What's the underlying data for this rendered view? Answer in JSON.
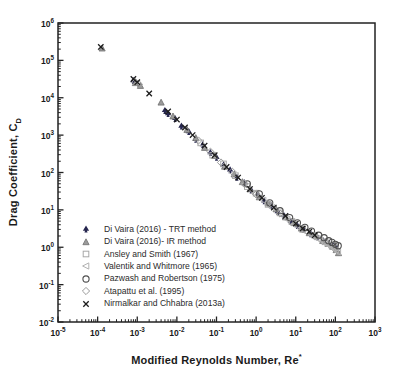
{
  "figure": {
    "background": "#ffffff",
    "text_color": "#1a1a1a",
    "axis_color": "#222222"
  },
  "chart_data": {
    "type": "scatter",
    "title": "",
    "xlabel": "Modified Reynolds Number, Re*",
    "ylabel": "Drag Coefficient, C_D",
    "xlabel_main": "Modified Reynolds Number, Re",
    "xlabel_sup": "*",
    "ylabel_main": "Drag Coefficient, C",
    "ylabel_sub": "D",
    "x_scale": "log",
    "y_scale": "log",
    "xlim": [
      1e-05,
      1000
    ],
    "ylim": [
      0.01,
      1000000
    ],
    "x_tick_exponents": [
      -5,
      -4,
      -3,
      -2,
      -1,
      0,
      1,
      2,
      3
    ],
    "y_tick_exponents": [
      6,
      5,
      4,
      3,
      2,
      1,
      0,
      -1,
      -2
    ],
    "grid": false,
    "legend_position": "inside-lower-left",
    "series": [
      {
        "name": "Di Vaira (2016) - TRT method",
        "marker": "club",
        "color": "#26264f",
        "fill": "#26264f",
        "points": [
          [
            0.0008,
            29000
          ],
          [
            0.005,
            4600
          ],
          [
            0.006,
            3800
          ],
          [
            0.009,
            2800
          ],
          [
            0.013,
            1750
          ],
          [
            0.02,
            1250
          ],
          [
            0.03,
            780
          ],
          [
            0.045,
            560
          ],
          [
            0.07,
            340
          ],
          [
            0.1,
            255
          ],
          [
            0.15,
            160
          ],
          [
            0.22,
            118
          ],
          [
            0.33,
            75
          ],
          [
            0.5,
            54
          ],
          [
            0.75,
            34
          ],
          [
            1.1,
            26
          ],
          [
            1.6,
            17.5
          ],
          [
            2.4,
            13
          ],
          [
            3.5,
            9
          ],
          [
            5,
            7.2
          ],
          [
            7.5,
            5
          ],
          [
            11,
            3.8
          ],
          [
            16,
            3.1
          ],
          [
            24,
            2.3
          ],
          [
            35,
            1.9
          ],
          [
            50,
            1.5
          ],
          [
            70,
            1.25
          ],
          [
            90,
            1.1
          ],
          [
            110,
            0.95
          ]
        ]
      },
      {
        "name": "Di Vaira (2016)- IR method",
        "marker": "triangle",
        "color": "#6e6e6e",
        "fill": "#9b9b9b",
        "points": [
          [
            0.00013,
            210000
          ],
          [
            0.0009,
            25000
          ],
          [
            0.0012,
            21000
          ],
          [
            0.004,
            7500
          ],
          [
            0.008,
            3200
          ],
          [
            0.018,
            1400
          ],
          [
            0.03,
            850
          ],
          [
            0.05,
            460
          ],
          [
            0.09,
            280
          ],
          [
            0.16,
            145
          ],
          [
            0.28,
            90
          ],
          [
            0.45,
            56
          ],
          [
            0.7,
            36
          ],
          [
            1.2,
            22
          ],
          [
            2,
            15
          ],
          [
            3.2,
            10.5
          ],
          [
            5.5,
            6.4
          ],
          [
            9,
            4.6
          ],
          [
            14,
            3.2
          ],
          [
            22,
            2.4
          ],
          [
            33,
            2
          ],
          [
            48,
            1.5
          ],
          [
            65,
            1.25
          ],
          [
            85,
            1.05
          ],
          [
            105,
            0.85
          ],
          [
            120,
            0.7
          ]
        ]
      },
      {
        "name": "Ansley and Smith (1967)",
        "marker": "square",
        "color": "#a8a8a8",
        "fill": "none",
        "points": [
          [
            0.04,
            620
          ],
          [
            0.08,
            290
          ],
          [
            0.15,
            170
          ],
          [
            0.3,
            82
          ],
          [
            0.6,
            42
          ],
          [
            1,
            28
          ],
          [
            2,
            14
          ],
          [
            4,
            8.3
          ],
          [
            8,
            4.9
          ],
          [
            15,
            3
          ],
          [
            30,
            2.1
          ],
          [
            55,
            1.4
          ],
          [
            80,
            1.15
          ],
          [
            100,
            1
          ]
        ]
      },
      {
        "name": "Valentik and Whitmore (1965)",
        "marker": "triangle-left",
        "color": "#b2b2b2",
        "fill": "none",
        "points": [
          [
            0.5,
            48
          ],
          [
            0.9,
            28
          ],
          [
            1.5,
            18
          ],
          [
            2.5,
            11.5
          ],
          [
            4,
            7.6
          ],
          [
            6,
            5.6
          ],
          [
            9,
            4.1
          ],
          [
            13,
            3.2
          ],
          [
            19,
            2.5
          ],
          [
            28,
            2
          ],
          [
            35,
            1.7
          ],
          [
            40,
            1.6
          ],
          [
            55,
            1.3
          ],
          [
            60,
            1.2
          ],
          [
            70,
            1.15
          ],
          [
            85,
            1
          ],
          [
            100,
            0.85
          ],
          [
            115,
            0.75
          ]
        ]
      },
      {
        "name": "Pazwash and Robertson (1975)",
        "marker": "circle",
        "color": "#4f4f4f",
        "fill": "none",
        "points": [
          [
            0.6,
            50
          ],
          [
            1.2,
            27
          ],
          [
            2.2,
            15.5
          ],
          [
            4,
            9.5
          ],
          [
            7,
            6.2
          ],
          [
            11,
            4.5
          ],
          [
            17,
            3.4
          ],
          [
            25,
            2.7
          ],
          [
            38,
            2.1
          ],
          [
            52,
            1.8
          ],
          [
            68,
            1.5
          ],
          [
            82,
            1.35
          ],
          [
            100,
            1.2
          ],
          [
            118,
            1.1
          ]
        ]
      },
      {
        "name": "Atapattu et al. (1995)",
        "marker": "diamond",
        "color": "#9a9a9a",
        "fill": "none",
        "points": [
          [
            0.0009,
            26000
          ],
          [
            0.0011,
            23000
          ],
          [
            0.035,
            720
          ],
          [
            0.07,
            360
          ],
          [
            0.13,
            185
          ],
          [
            0.25,
            105
          ],
          [
            0.5,
            50
          ],
          [
            1,
            26
          ],
          [
            2,
            15
          ],
          [
            4,
            8
          ],
          [
            8,
            4.6
          ],
          [
            15,
            3
          ],
          [
            30,
            2
          ]
        ]
      },
      {
        "name": "Nirmalkar and Chhabra (2013a)",
        "marker": "x",
        "color": "#1c1c1c",
        "fill": "none",
        "points": [
          [
            0.00012,
            230000
          ],
          [
            0.0008,
            32000
          ],
          [
            0.001,
            26000
          ],
          [
            0.002,
            13000
          ],
          [
            0.006,
            4300
          ],
          [
            0.01,
            2600
          ],
          [
            0.016,
            1600
          ],
          [
            0.025,
            1000
          ],
          [
            0.05,
            520
          ],
          [
            0.09,
            290
          ],
          [
            0.18,
            140
          ],
          [
            0.35,
            73
          ],
          [
            0.7,
            36
          ],
          [
            1.4,
            21
          ],
          [
            2.8,
            11.5
          ],
          [
            5.5,
            6.9
          ],
          [
            10,
            4.3
          ],
          [
            15,
            3.2
          ],
          [
            22,
            2.6
          ],
          [
            30,
            2.1
          ]
        ]
      }
    ]
  }
}
